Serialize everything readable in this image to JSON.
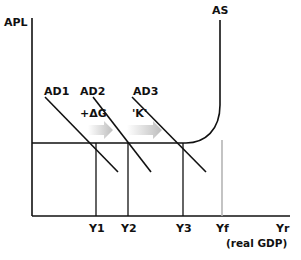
{
  "diagram": {
    "type": "macroeconomics-keynesian-multiplier",
    "y_axis_label": "APL",
    "x_axis_label": "Yr",
    "x_axis_sublabel": "(real GDP)",
    "curves": {
      "as_label": "AS",
      "ad1_label": "AD1",
      "ad2_label": "AD2",
      "ad3_label": "AD3"
    },
    "shifts": {
      "delta_g_label": "+ΔG",
      "multiplier_label": "'K'"
    },
    "x_ticks": [
      "Y1",
      "Y2",
      "Y3",
      "Yf"
    ],
    "colors": {
      "line": "#111111",
      "full_employment_line": "#b0b0b0",
      "arrow": "#c8c8c8"
    }
  }
}
